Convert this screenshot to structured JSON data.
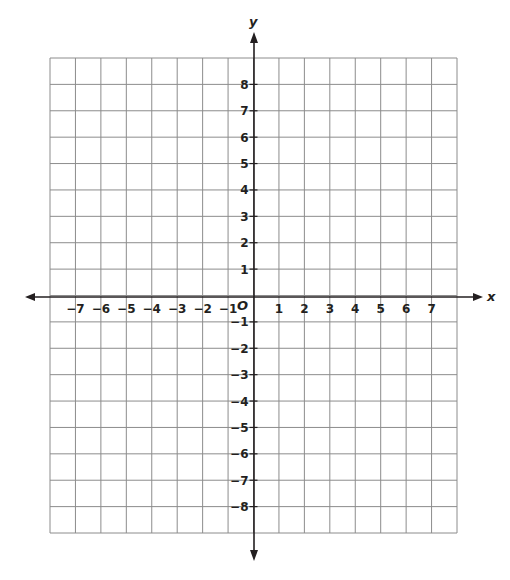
{
  "diagram": {
    "type": "coordinate-plane",
    "axes": {
      "x_label": "x",
      "y_label": "y",
      "origin_label": "O"
    },
    "x_ticks": [
      "−7",
      "−6",
      "−5",
      "−4",
      "−3",
      "−2",
      "−1",
      "1",
      "2",
      "3",
      "4",
      "5",
      "6",
      "7"
    ],
    "x_tick_values": [
      -7,
      -6,
      -5,
      -4,
      -3,
      -2,
      -1,
      1,
      2,
      3,
      4,
      5,
      6,
      7
    ],
    "y_ticks": [
      "8",
      "7",
      "6",
      "5",
      "4",
      "3",
      "2",
      "1",
      "−1",
      "−2",
      "−3",
      "−4",
      "−5",
      "−6",
      "−7",
      "−8"
    ],
    "y_tick_values": [
      8,
      7,
      6,
      5,
      4,
      3,
      2,
      1,
      -1,
      -2,
      -3,
      -4,
      -5,
      -6,
      -7,
      -8
    ],
    "grid": {
      "columns": 16,
      "rows": 18,
      "x_range": [
        -8,
        8
      ],
      "y_range": [
        -9,
        9
      ]
    },
    "colors": {
      "grid_line": "#8c8c8c",
      "axis": "#231f20",
      "text": "#231f20"
    }
  }
}
